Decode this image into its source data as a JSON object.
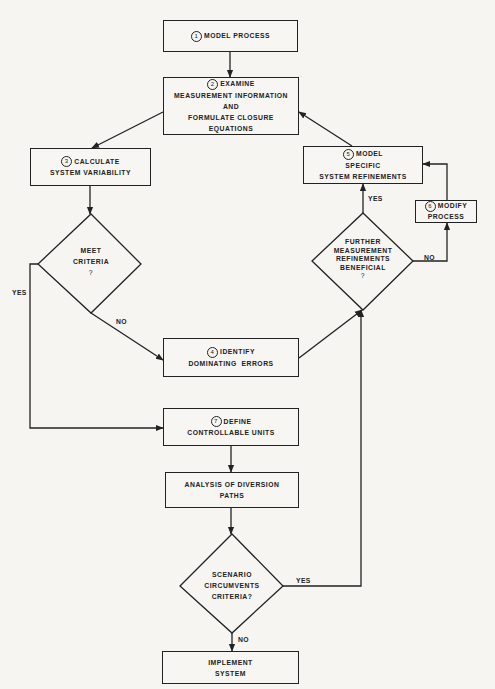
{
  "flowchart": {
    "steps": {
      "model_process": {
        "number": "1",
        "lines": [
          "MODEL PROCESS"
        ]
      },
      "examine": {
        "number": "2",
        "lines": [
          "EXAMINE",
          "MEASUREMENT INFORMATION",
          "AND",
          "FORMULATE CLOSURE",
          "EQUATIONS"
        ]
      },
      "calculate": {
        "number": "3",
        "lines": [
          "CALCULATE",
          "SYSTEM VARIABILITY"
        ]
      },
      "identify": {
        "number": "4",
        "lines": [
          "IDENTIFY",
          "DOMINATING  ERRORS"
        ]
      },
      "model_specific": {
        "number": "5",
        "lines": [
          "MODEL",
          "SPECIFIC",
          "SYSTEM REFINEMENTS"
        ]
      },
      "modify": {
        "number": "6",
        "lines": [
          "MODIFY",
          "PROCESS"
        ]
      },
      "define": {
        "number": "7",
        "lines": [
          "DEFINE",
          "CONTROLLABLE UNITS"
        ]
      },
      "analysis": {
        "lines": [
          "ANALYSIS OF DIVERSION",
          "PATHS"
        ]
      },
      "implement": {
        "lines": [
          "IMPLEMENT",
          "SYSTEM"
        ]
      }
    },
    "decisions": {
      "meet_criteria": {
        "lines": [
          "MEET",
          "CRITERIA",
          "?"
        ],
        "yes": "YES",
        "no": "NO"
      },
      "further_refinements": {
        "lines": [
          "FURTHER",
          "MEASUREMENT",
          "REFINEMENTS",
          "BENEFICIAL",
          "?"
        ],
        "yes": "YES",
        "no": "NO"
      },
      "scenario": {
        "lines": [
          "SCENARIO",
          "CIRCUMVENTS",
          "CRITERIA?"
        ],
        "yes": "YES",
        "no": "NO"
      }
    }
  }
}
